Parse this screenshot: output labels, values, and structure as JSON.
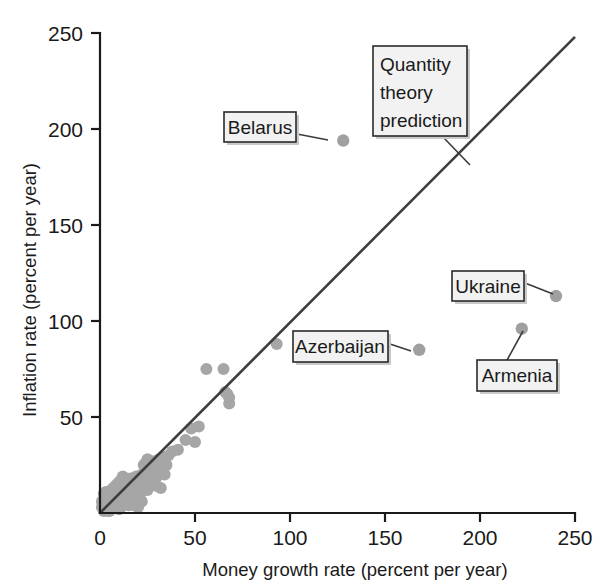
{
  "chart_data": {
    "type": "scatter",
    "title": "",
    "xlabel": "Money growth rate (percent per year)",
    "ylabel": "Inflation rate (percent per year)",
    "xlim": [
      0,
      250
    ],
    "ylim": [
      0,
      250
    ],
    "xticks": [
      "0",
      "50",
      "100",
      "150",
      "200",
      "250"
    ],
    "xtick_values": [
      0,
      50,
      100,
      150,
      200,
      250
    ],
    "yticks": [
      "0",
      "50",
      "100",
      "150",
      "200",
      "250"
    ],
    "ytick_values": [
      0,
      50,
      100,
      150,
      200,
      250
    ],
    "grid": false,
    "legend": null,
    "marker_color": "#a6a6a6",
    "line_color": "#3d3d3d",
    "reference_line": {
      "label": "Quantity theory prediction",
      "x": [
        0,
        250
      ],
      "y": [
        0,
        248
      ],
      "slope": 1,
      "intercept": 0
    },
    "annotations": [
      {
        "label": "Belarus",
        "x": 128,
        "y": 194
      },
      {
        "label": "Quantity theory prediction",
        "x": 190,
        "y": 190
      },
      {
        "label": "Ukraine",
        "x": 240,
        "y": 113
      },
      {
        "label": "Azerbaijan",
        "x": 168,
        "y": 85
      },
      {
        "label": "Armenia",
        "x": 222,
        "y": 96
      }
    ],
    "points": [
      [
        128,
        194
      ],
      [
        168,
        85
      ],
      [
        240,
        113
      ],
      [
        222,
        96
      ],
      [
        93,
        88
      ],
      [
        67,
        62
      ],
      [
        68,
        60
      ],
      [
        66,
        63
      ],
      [
        68,
        57
      ],
      [
        65,
        75
      ],
      [
        56,
        75
      ],
      [
        52,
        45
      ],
      [
        48,
        44
      ],
      [
        45,
        38
      ],
      [
        50,
        37
      ],
      [
        41,
        33
      ],
      [
        38,
        32
      ],
      [
        36,
        30
      ],
      [
        34,
        29
      ],
      [
        35,
        25
      ],
      [
        33,
        24
      ],
      [
        32,
        23
      ],
      [
        31,
        28
      ],
      [
        30,
        26
      ],
      [
        33,
        21
      ],
      [
        34,
        20
      ],
      [
        30,
        19
      ],
      [
        29,
        22
      ],
      [
        28,
        27
      ],
      [
        26,
        24
      ],
      [
        24,
        26
      ],
      [
        23,
        25
      ],
      [
        30,
        14
      ],
      [
        32,
        13
      ],
      [
        27,
        16
      ],
      [
        25,
        18
      ],
      [
        22,
        20
      ],
      [
        21,
        17
      ],
      [
        20,
        16
      ],
      [
        19,
        19
      ],
      [
        18,
        15
      ],
      [
        17,
        14
      ],
      [
        16,
        18
      ],
      [
        16,
        12
      ],
      [
        15,
        13
      ],
      [
        14,
        15
      ],
      [
        13,
        11
      ],
      [
        12,
        14
      ],
      [
        12,
        10
      ],
      [
        11,
        12
      ],
      [
        10,
        13
      ],
      [
        10,
        9
      ],
      [
        9,
        11
      ],
      [
        9,
        8
      ],
      [
        8,
        10
      ],
      [
        8,
        7
      ],
      [
        7,
        9
      ],
      [
        7,
        6
      ],
      [
        6,
        8
      ],
      [
        6,
        5
      ],
      [
        5,
        7
      ],
      [
        5,
        4
      ],
      [
        4,
        6
      ],
      [
        4,
        3
      ],
      [
        3,
        5
      ],
      [
        3,
        2
      ],
      [
        2,
        4
      ],
      [
        2,
        1
      ],
      [
        14,
        6
      ],
      [
        13,
        5
      ],
      [
        12,
        4
      ],
      [
        11,
        3
      ],
      [
        10,
        2
      ],
      [
        15,
        8
      ],
      [
        16,
        7
      ],
      [
        17,
        5
      ],
      [
        18,
        4
      ],
      [
        19,
        6
      ],
      [
        20,
        3
      ],
      [
        11,
        7
      ],
      [
        12,
        8
      ],
      [
        13,
        9
      ],
      [
        14,
        10
      ],
      [
        15,
        4
      ],
      [
        9,
        3
      ],
      [
        8,
        4
      ],
      [
        7,
        3
      ],
      [
        6,
        2
      ],
      [
        5,
        1
      ],
      [
        4,
        1
      ],
      [
        3,
        8
      ],
      [
        2,
        7
      ],
      [
        6,
        12
      ],
      [
        7,
        13
      ],
      [
        8,
        14
      ],
      [
        5,
        10
      ],
      [
        4,
        9
      ],
      [
        3,
        11
      ],
      [
        21,
        12
      ],
      [
        22,
        11
      ],
      [
        23,
        13
      ],
      [
        24,
        14
      ],
      [
        25,
        12
      ],
      [
        26,
        15
      ],
      [
        17,
        9
      ],
      [
        18,
        8
      ],
      [
        19,
        10
      ],
      [
        20,
        9
      ],
      [
        21,
        7
      ],
      [
        22,
        6
      ],
      [
        9,
        15
      ],
      [
        10,
        16
      ],
      [
        11,
        17
      ],
      [
        1,
        3
      ],
      [
        1,
        6
      ],
      [
        2,
        10
      ],
      [
        12,
        19
      ],
      [
        13,
        18
      ],
      [
        25,
        28
      ],
      [
        27,
        21
      ],
      [
        29,
        15
      ]
    ]
  },
  "axes": {
    "x_title": "Money growth rate (percent per year)",
    "y_title": "Inflation rate (percent per year)"
  },
  "callouts": {
    "belarus": "Belarus",
    "quantity_line1": "Quantity",
    "quantity_line2": "theory",
    "quantity_line3": "prediction",
    "ukraine": "Ukraine",
    "azerbaijan": "Azerbaijan",
    "armenia": "Armenia"
  },
  "ticks": {
    "x": [
      "0",
      "50",
      "100",
      "150",
      "200",
      "250"
    ],
    "y": [
      "0",
      "50",
      "100",
      "150",
      "200",
      "250"
    ]
  },
  "colors": {
    "marker": "#a6a6a6",
    "line": "#3d3d3d",
    "axis": "#1a1a1a",
    "callout_fill": "#f2f2f2",
    "callout_border": "#2a2a2a"
  }
}
